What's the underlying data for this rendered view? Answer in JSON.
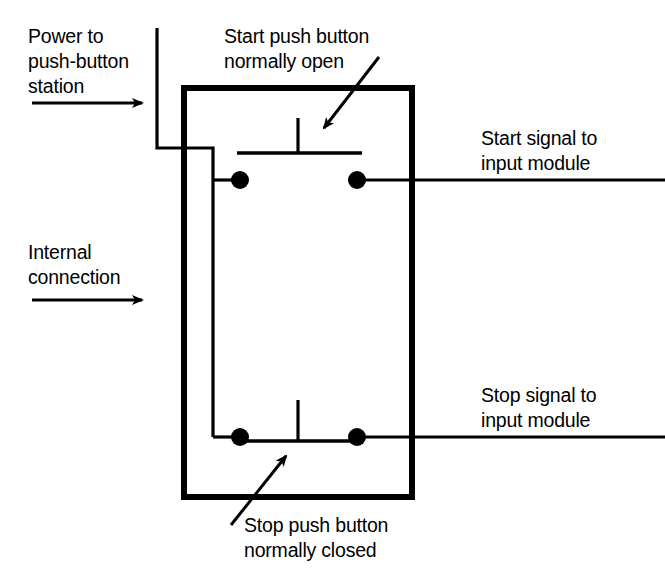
{
  "diagram": {
    "type": "electrical-wiring-schematic",
    "stroke_color": "#000000",
    "background_color": "#ffffff",
    "enclosure": {
      "name": "push-button station enclosure",
      "stroke_width": 6,
      "x": 184,
      "y": 88,
      "width": 228,
      "height": 409
    },
    "labels": {
      "power": "Power to\npush-button\nstation",
      "internal": "Internal\nconnection",
      "start_button": "Start push button\nnormally open",
      "start_signal": "Start signal to\ninput module",
      "stop_signal": "Stop signal to\ninput module",
      "stop_button": "Stop push button\nnormally closed"
    },
    "switches": [
      {
        "name": "start-push-button",
        "state": "normally open",
        "terminal_left": {
          "x": 240,
          "y": 180
        },
        "terminal_right": {
          "x": 357,
          "y": 180
        },
        "contact_bar": {
          "x1": 237,
          "y1": 153,
          "x2": 362,
          "y2": 153
        },
        "actuator_stem": {
          "x": 298,
          "y_top": 118,
          "y_bottom": 153
        }
      },
      {
        "name": "stop-push-button",
        "state": "normally closed",
        "terminal_left": {
          "x": 240,
          "y": 437
        },
        "terminal_right": {
          "x": 357,
          "y": 437
        },
        "contact_bar": {
          "x1": 237,
          "y1": 441,
          "x2": 362,
          "y2": 441
        },
        "actuator_stem": {
          "x": 298,
          "y_top": 400,
          "y_bottom": 441
        }
      }
    ],
    "terminal_dot_radius": 9,
    "wires": {
      "power_feed": "M157,28 L157,148 L213,148 L213,437",
      "start_tap": "M213,180 L240,180",
      "stop_tap": "M213,437 L240,437",
      "start_signal_out": "M357,180 L665,180",
      "stop_signal_out": "M357,437 L665,437"
    },
    "pointer_arrows": [
      {
        "name": "power-arrow",
        "from": {
          "x": 32,
          "y": 103
        },
        "to": {
          "x": 150,
          "y": 103
        },
        "direction": "right"
      },
      {
        "name": "internal-arrow",
        "from": {
          "x": 32,
          "y": 300
        },
        "to": {
          "x": 150,
          "y": 300
        },
        "direction": "right"
      },
      {
        "name": "start-button-arrow",
        "from": {
          "x": 378,
          "y": 58
        },
        "to": {
          "x": 320,
          "y": 134
        },
        "direction": "down-left"
      },
      {
        "name": "stop-button-arrow",
        "from": {
          "x": 232,
          "y": 524
        },
        "to": {
          "x": 283,
          "y": 452
        },
        "direction": "up-right"
      }
    ]
  }
}
